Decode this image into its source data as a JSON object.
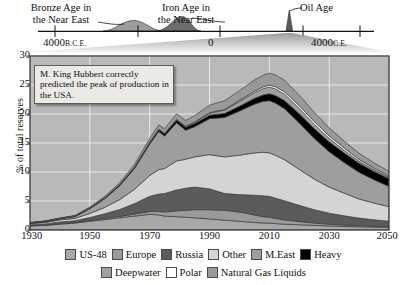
{
  "timeline": {
    "labels": [
      {
        "name": "bronze",
        "text": "Bronze Age in\nthe Near East"
      },
      {
        "name": "iron",
        "text": "Iron Age in\nthe Near East"
      },
      {
        "name": "oil",
        "text": "Oil Age"
      }
    ],
    "axis_ticks": [
      {
        "name": "left",
        "value": "4000",
        "era": "B.C.E."
      },
      {
        "name": "mid",
        "value": "0",
        "era": ""
      },
      {
        "name": "right",
        "value": "4000",
        "era": "C.E."
      }
    ],
    "humps": [
      {
        "name": "bronze-age-hump",
        "center": -2000,
        "label": "Bronze Age in the Near East"
      },
      {
        "name": "iron-age-hump",
        "center": -700,
        "label": "Iron Age in the Near East"
      },
      {
        "name": "oil-age-spike",
        "center": 2000,
        "label": "Oil Age"
      }
    ],
    "range": [
      -5000,
      5000
    ]
  },
  "annotation": {
    "text": "M. King Hubbert correctly predicted the peak of production in the USA."
  },
  "colors": {
    "us48": "#a8a8a8",
    "europe": "#9a9a9a",
    "russia": "#5b5b5b",
    "other": "#d4d4d4",
    "meast": "#9e9e9e",
    "heavy": "#000000",
    "deepwater": "#a0a0a0",
    "polar": "#ffffff",
    "ngl": "#999999",
    "plot_bg": "#b9b9b9",
    "grid": "#e8e8e8",
    "frame": "#3a3a3a",
    "annotation_bg": "#eceae5"
  },
  "chart_data": {
    "type": "area",
    "title": "",
    "xlabel": "",
    "ylabel": "% of total reserves",
    "xlim": [
      1930,
      2050
    ],
    "ylim": [
      0,
      30
    ],
    "xticks": [
      1930,
      1950,
      1970,
      1990,
      2010,
      2030,
      2050
    ],
    "yticks": [
      0,
      5,
      10,
      15,
      20,
      25,
      30
    ],
    "grid": true,
    "legend_position": "bottom",
    "stacked": true,
    "x": [
      1930,
      1935,
      1940,
      1945,
      1950,
      1955,
      1960,
      1965,
      1970,
      1973,
      1975,
      1979,
      1982,
      1985,
      1990,
      1995,
      2000,
      2005,
      2008,
      2010,
      2012,
      2015,
      2020,
      2025,
      2030,
      2035,
      2040,
      2045,
      2050
    ],
    "series": [
      {
        "name": "US-48",
        "color": "#a8a8a8",
        "values": [
          0.7,
          0.8,
          1.0,
          1.2,
          1.5,
          1.8,
          2.1,
          2.4,
          2.7,
          2.6,
          2.4,
          2.3,
          2.2,
          2.1,
          1.9,
          1.7,
          1.5,
          1.3,
          1.2,
          1.2,
          1.1,
          1.0,
          0.9,
          0.8,
          0.7,
          0.6,
          0.55,
          0.5,
          0.45
        ]
      },
      {
        "name": "Europe",
        "color": "#9a9a9a",
        "values": [
          0.05,
          0.05,
          0.1,
          0.1,
          0.15,
          0.2,
          0.25,
          0.35,
          0.5,
          0.6,
          0.7,
          1.0,
          1.2,
          1.4,
          1.6,
          1.7,
          1.6,
          1.3,
          1.1,
          1.0,
          0.9,
          0.75,
          0.55,
          0.4,
          0.3,
          0.25,
          0.2,
          0.15,
          0.12
        ]
      },
      {
        "name": "Russia",
        "color": "#5b5b5b",
        "values": [
          0.15,
          0.2,
          0.3,
          0.3,
          0.5,
          0.8,
          1.2,
          1.8,
          2.6,
          3.0,
          3.2,
          3.6,
          3.8,
          3.9,
          3.6,
          2.9,
          3.0,
          3.4,
          3.6,
          3.6,
          3.5,
          3.3,
          2.8,
          2.3,
          1.9,
          1.6,
          1.3,
          1.1,
          0.95
        ]
      },
      {
        "name": "Other",
        "color": "#d4d4d4",
        "values": [
          0.2,
          0.25,
          0.35,
          0.4,
          0.7,
          1.1,
          1.7,
          2.5,
          3.6,
          4.2,
          4.3,
          5.0,
          5.0,
          5.2,
          5.9,
          6.3,
          6.8,
          7.3,
          7.5,
          7.5,
          7.4,
          7.1,
          6.2,
          5.3,
          4.5,
          3.9,
          3.3,
          2.9,
          2.5
        ]
      },
      {
        "name": "M.East",
        "color": "#9e9e9e",
        "values": [
          0.05,
          0.1,
          0.15,
          0.3,
          0.8,
          1.5,
          2.4,
          3.6,
          5.4,
          6.6,
          5.6,
          6.6,
          5.0,
          5.2,
          6.2,
          6.8,
          7.6,
          8.4,
          8.8,
          9.0,
          9.0,
          8.8,
          8.0,
          7.0,
          6.1,
          5.3,
          4.6,
          4.0,
          3.5
        ]
      },
      {
        "name": "Heavy",
        "color": "#000000",
        "values": [
          0.1,
          0.1,
          0.1,
          0.12,
          0.15,
          0.18,
          0.2,
          0.25,
          0.3,
          0.35,
          0.4,
          0.45,
          0.5,
          0.55,
          0.6,
          0.7,
          0.85,
          1.0,
          1.1,
          1.2,
          1.3,
          1.4,
          1.6,
          1.7,
          1.7,
          1.65,
          1.55,
          1.45,
          1.35
        ]
      },
      {
        "name": "Deepwater",
        "color": "#a0a0a0",
        "values": [
          0,
          0,
          0,
          0,
          0,
          0,
          0,
          0,
          0.02,
          0.04,
          0.06,
          0.1,
          0.15,
          0.2,
          0.35,
          0.55,
          0.8,
          1.0,
          1.1,
          1.15,
          1.15,
          1.1,
          0.95,
          0.75,
          0.6,
          0.45,
          0.35,
          0.28,
          0.22
        ]
      },
      {
        "name": "Polar",
        "color": "#ffffff",
        "values": [
          0,
          0,
          0,
          0,
          0,
          0,
          0,
          0,
          0,
          0,
          0.01,
          0.02,
          0.03,
          0.05,
          0.08,
          0.12,
          0.18,
          0.25,
          0.3,
          0.33,
          0.36,
          0.4,
          0.45,
          0.45,
          0.42,
          0.38,
          0.32,
          0.27,
          0.22
        ]
      },
      {
        "name": "Natural Gas Liquids",
        "color": "#999999",
        "values": [
          0.05,
          0.06,
          0.08,
          0.1,
          0.15,
          0.22,
          0.3,
          0.45,
          0.65,
          0.75,
          0.8,
          0.95,
          1.0,
          1.1,
          1.3,
          1.5,
          1.7,
          1.9,
          2.0,
          2.05,
          2.05,
          2.0,
          1.8,
          1.6,
          1.4,
          1.2,
          1.05,
          0.9,
          0.8
        ]
      }
    ]
  },
  "legend": {
    "rows": [
      [
        {
          "label": "US-48",
          "color": "#a8a8a8"
        },
        {
          "label": "Europe",
          "color": "#9a9a9a"
        },
        {
          "label": "Russia",
          "color": "#5b5b5b"
        },
        {
          "label": "Other",
          "color": "#d4d4d4"
        },
        {
          "label": "M.East",
          "color": "#9e9e9e"
        },
        {
          "label": "Heavy",
          "color": "#000000"
        }
      ],
      [
        {
          "label": "Deepwater",
          "color": "#a0a0a0"
        },
        {
          "label": "Polar",
          "color": "#ffffff"
        },
        {
          "label": "Natural Gas Liquids",
          "color": "#999999"
        }
      ]
    ]
  }
}
